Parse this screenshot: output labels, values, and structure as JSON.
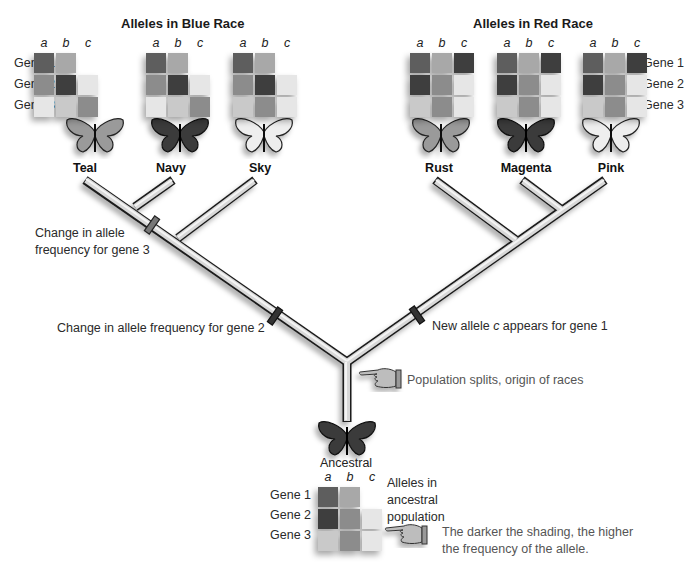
{
  "titles": {
    "blue": "Alleles in Blue Race",
    "red": "Alleles in Red Race"
  },
  "allele_labels": [
    "a",
    "b",
    "c"
  ],
  "gene_labels": [
    "Gene 1",
    "Gene 2",
    "Gene 3"
  ],
  "shade_scale": {
    "0": "transparent",
    "1": "#e6e6e6",
    "2": "#c9c9c9",
    "3": "#a8a8a8",
    "4": "#8c8c8c",
    "5": "#5e5e5e",
    "6": "#3e3e3e"
  },
  "races": [
    {
      "name": "Teal",
      "group": "blue",
      "butterfly": "gray",
      "grid": [
        [
          5,
          3,
          0
        ],
        [
          4,
          6,
          1
        ],
        [
          1,
          2,
          4
        ]
      ]
    },
    {
      "name": "Navy",
      "group": "blue",
      "butterfly": "dark",
      "grid": [
        [
          5,
          3,
          0
        ],
        [
          4,
          6,
          1
        ],
        [
          1,
          2,
          4
        ]
      ]
    },
    {
      "name": "Sky",
      "group": "blue",
      "butterfly": "light",
      "grid": [
        [
          5,
          3,
          0
        ],
        [
          4,
          6,
          1
        ],
        [
          2,
          4,
          1
        ]
      ]
    },
    {
      "name": "Rust",
      "group": "red",
      "butterfly": "gray",
      "grid": [
        [
          5,
          3,
          6
        ],
        [
          6,
          4,
          1
        ],
        [
          2,
          4,
          1
        ]
      ]
    },
    {
      "name": "Magenta",
      "group": "red",
      "butterfly": "dark",
      "grid": [
        [
          5,
          3,
          6
        ],
        [
          6,
          4,
          1
        ],
        [
          2,
          4,
          1
        ]
      ]
    },
    {
      "name": "Pink",
      "group": "red",
      "butterfly": "light",
      "grid": [
        [
          5,
          3,
          6
        ],
        [
          6,
          4,
          1
        ],
        [
          2,
          4,
          1
        ]
      ]
    }
  ],
  "ancestral": {
    "name": "Ancestral",
    "grid": [
      [
        5,
        3,
        0
      ],
      [
        6,
        4,
        1
      ],
      [
        2,
        4,
        1
      ]
    ],
    "caption_lines": [
      "Alleles in",
      "ancestral",
      "population"
    ]
  },
  "annotations": {
    "gene3_line1": "Change in allele",
    "gene3_line2": "frequency for gene 3",
    "gene2": "Change in allele frequency for gene 2",
    "gene1_prefix": "New allele ",
    "gene1_allele": "c",
    "gene1_suffix": " appears for gene 1",
    "split": "Population splits, origin of races",
    "legend_line1": "The darker the shading, the higher",
    "legend_line2": "the frequency of the allele."
  }
}
